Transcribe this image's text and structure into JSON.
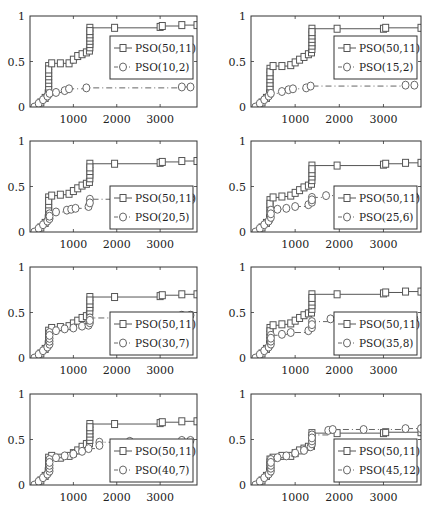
{
  "figure": {
    "layout": {
      "rows": 4,
      "cols": 2
    },
    "x_ticks": [
      1000,
      2000,
      3000
    ],
    "y_ticks": [
      0,
      0.5,
      1
    ],
    "y_tick_labels": [
      "0",
      "0.5",
      "1"
    ],
    "x_tick_labels": [
      "1000",
      "2000",
      "3000"
    ],
    "colors": {
      "axis": "#333333",
      "series_square": "#555555",
      "series_circle": "#666666"
    }
  },
  "chart_data": [
    {
      "type": "line",
      "title": "",
      "xlabel": "",
      "ylabel": "",
      "xlim": [
        0,
        3850
      ],
      "ylim": [
        0,
        1
      ],
      "legend": [
        "PSO(50,11)",
        "PSO(10,2)"
      ],
      "legend_position": "upper right (inside)",
      "series": [
        {
          "name": "PSO(50,11)",
          "marker": "square",
          "line": "solid",
          "x": [
            150,
            250,
            350,
            420,
            430,
            500,
            700,
            900,
            1000,
            1100,
            1200,
            1300,
            1370,
            1380,
            1950,
            3000,
            3050,
            3500,
            3850
          ],
          "y": [
            0.0,
            0.05,
            0.1,
            0.15,
            0.45,
            0.48,
            0.48,
            0.48,
            0.52,
            0.56,
            0.58,
            0.6,
            0.62,
            0.87,
            0.87,
            0.88,
            0.89,
            0.9,
            0.9
          ]
        },
        {
          "name": "PSO(10,2)",
          "marker": "circle",
          "line": "dashdot",
          "x": [
            100,
            200,
            300,
            400,
            450,
            600,
            800,
            900,
            1300,
            3500,
            3700
          ],
          "y": [
            0.0,
            0.04,
            0.08,
            0.12,
            0.15,
            0.16,
            0.18,
            0.2,
            0.21,
            0.22,
            0.22
          ]
        }
      ]
    },
    {
      "type": "line",
      "title": "",
      "xlabel": "",
      "ylabel": "",
      "xlim": [
        0,
        3850
      ],
      "ylim": [
        0,
        1
      ],
      "legend": [
        "PSO(50,11)",
        "PSO(15,2)"
      ],
      "legend_position": "upper right (inside)",
      "series": [
        {
          "name": "PSO(50,11)",
          "marker": "square",
          "line": "solid",
          "x": [
            150,
            250,
            350,
            420,
            430,
            500,
            700,
            900,
            1000,
            1100,
            1200,
            1300,
            1370,
            1380,
            1950,
            3000,
            3050,
            3850
          ],
          "y": [
            0.0,
            0.05,
            0.1,
            0.15,
            0.42,
            0.45,
            0.45,
            0.46,
            0.49,
            0.52,
            0.55,
            0.58,
            0.6,
            0.86,
            0.86,
            0.86,
            0.87,
            0.87
          ]
        },
        {
          "name": "PSO(15,2)",
          "marker": "circle",
          "line": "dashdot",
          "x": [
            100,
            200,
            300,
            400,
            450,
            700,
            850,
            950,
            1250,
            1350,
            3500,
            3700
          ],
          "y": [
            0.0,
            0.04,
            0.08,
            0.12,
            0.15,
            0.17,
            0.19,
            0.2,
            0.21,
            0.23,
            0.24,
            0.24
          ]
        }
      ]
    },
    {
      "type": "line",
      "title": "",
      "xlabel": "",
      "ylabel": "",
      "xlim": [
        0,
        3850
      ],
      "ylim": [
        0,
        1
      ],
      "legend": [
        "PSO(50,11)",
        "PSO(20,5)"
      ],
      "legend_position": "lower right (inside)",
      "series": [
        {
          "name": "PSO(50,11)",
          "marker": "square",
          "line": "solid",
          "x": [
            150,
            250,
            350,
            420,
            430,
            500,
            700,
            900,
            1000,
            1100,
            1200,
            1300,
            1370,
            1380,
            1950,
            3000,
            3050,
            3500,
            3850
          ],
          "y": [
            0.0,
            0.05,
            0.1,
            0.15,
            0.38,
            0.4,
            0.41,
            0.42,
            0.45,
            0.48,
            0.51,
            0.53,
            0.55,
            0.75,
            0.75,
            0.76,
            0.77,
            0.78,
            0.78
          ]
        },
        {
          "name": "PSO(20,5)",
          "marker": "circle",
          "line": "dashdot",
          "x": [
            100,
            200,
            300,
            400,
            450,
            600,
            850,
            950,
            1050,
            1350,
            1380,
            3500,
            3700
          ],
          "y": [
            0.0,
            0.04,
            0.08,
            0.12,
            0.2,
            0.22,
            0.24,
            0.25,
            0.26,
            0.28,
            0.36,
            0.37,
            0.37
          ]
        }
      ]
    },
    {
      "type": "line",
      "title": "",
      "xlabel": "",
      "ylabel": "",
      "xlim": [
        0,
        3850
      ],
      "ylim": [
        0,
        1
      ],
      "legend": [
        "PSO(50,11)",
        "PSO(25,6)"
      ],
      "legend_position": "lower right (inside)",
      "series": [
        {
          "name": "PSO(50,11)",
          "marker": "square",
          "line": "solid",
          "x": [
            150,
            250,
            350,
            420,
            430,
            500,
            700,
            900,
            1000,
            1100,
            1200,
            1300,
            1370,
            1380,
            1950,
            3000,
            3050,
            3500,
            3850
          ],
          "y": [
            0.0,
            0.05,
            0.1,
            0.15,
            0.35,
            0.38,
            0.39,
            0.4,
            0.43,
            0.46,
            0.49,
            0.51,
            0.53,
            0.73,
            0.73,
            0.74,
            0.75,
            0.76,
            0.76
          ]
        },
        {
          "name": "PSO(25,6)",
          "marker": "circle",
          "line": "dashdot",
          "x": [
            100,
            200,
            300,
            400,
            450,
            600,
            800,
            1000,
            1300,
            1380,
            1700,
            3500,
            3700
          ],
          "y": [
            0.0,
            0.04,
            0.08,
            0.12,
            0.24,
            0.25,
            0.26,
            0.28,
            0.3,
            0.38,
            0.4,
            0.4,
            0.4
          ]
        }
      ]
    },
    {
      "type": "line",
      "title": "",
      "xlabel": "",
      "ylabel": "",
      "xlim": [
        0,
        3850
      ],
      "ylim": [
        0,
        1
      ],
      "legend": [
        "PSO(50,11)",
        "PSO(30,7)"
      ],
      "legend_position": "lower right (inside)",
      "series": [
        {
          "name": "PSO(50,11)",
          "marker": "square",
          "line": "solid",
          "x": [
            150,
            250,
            350,
            420,
            430,
            500,
            700,
            900,
            1000,
            1100,
            1200,
            1300,
            1370,
            1380,
            1950,
            3000,
            3050,
            3500,
            3850
          ],
          "y": [
            0.0,
            0.05,
            0.1,
            0.15,
            0.3,
            0.33,
            0.34,
            0.35,
            0.38,
            0.41,
            0.44,
            0.46,
            0.48,
            0.67,
            0.67,
            0.68,
            0.69,
            0.7,
            0.7
          ]
        },
        {
          "name": "PSO(30,7)",
          "marker": "circle",
          "line": "dashdot",
          "x": [
            100,
            200,
            300,
            400,
            450,
            600,
            800,
            1000,
            1200,
            1350,
            1380,
            3500,
            3700
          ],
          "y": [
            0.0,
            0.04,
            0.08,
            0.12,
            0.28,
            0.3,
            0.32,
            0.33,
            0.35,
            0.36,
            0.44,
            0.47,
            0.47
          ]
        }
      ]
    },
    {
      "type": "line",
      "title": "",
      "xlabel": "",
      "ylabel": "",
      "xlim": [
        0,
        3850
      ],
      "ylim": [
        0,
        1
      ],
      "legend": [
        "PSO(50,11)",
        "PSO(35,8)"
      ],
      "legend_position": "lower right (inside)",
      "series": [
        {
          "name": "PSO(50,11)",
          "marker": "square",
          "line": "solid",
          "x": [
            150,
            250,
            350,
            420,
            430,
            500,
            700,
            900,
            1000,
            1100,
            1200,
            1300,
            1370,
            1380,
            1950,
            3000,
            3050,
            3500,
            3850
          ],
          "y": [
            0.0,
            0.05,
            0.1,
            0.15,
            0.33,
            0.36,
            0.37,
            0.38,
            0.41,
            0.44,
            0.47,
            0.49,
            0.5,
            0.7,
            0.7,
            0.71,
            0.72,
            0.73,
            0.73
          ]
        },
        {
          "name": "PSO(35,8)",
          "marker": "circle",
          "line": "dashdot",
          "x": [
            100,
            200,
            300,
            400,
            450,
            700,
            900,
            1300,
            1380,
            1800,
            3500,
            3700
          ],
          "y": [
            0.0,
            0.04,
            0.08,
            0.12,
            0.25,
            0.26,
            0.28,
            0.3,
            0.4,
            0.43,
            0.43,
            0.43
          ]
        }
      ]
    },
    {
      "type": "line",
      "title": "",
      "xlabel": "",
      "ylabel": "",
      "xlim": [
        0,
        3850
      ],
      "ylim": [
        0,
        1
      ],
      "legend": [
        "PSO(50,11)",
        "PSO(40,7)"
      ],
      "legend_position": "lower right (inside)",
      "series": [
        {
          "name": "PSO(50,11)",
          "marker": "square",
          "line": "solid",
          "x": [
            150,
            250,
            350,
            420,
            430,
            500,
            700,
            900,
            1000,
            1100,
            1200,
            1300,
            1370,
            1380,
            1950,
            3000,
            3050,
            3500,
            3850
          ],
          "y": [
            0.0,
            0.05,
            0.1,
            0.15,
            0.3,
            0.32,
            0.3,
            0.32,
            0.35,
            0.38,
            0.42,
            0.45,
            0.46,
            0.67,
            0.67,
            0.68,
            0.69,
            0.7,
            0.7
          ]
        },
        {
          "name": "PSO(40,7)",
          "marker": "circle",
          "line": "dashdot",
          "x": [
            100,
            200,
            300,
            400,
            450,
            600,
            800,
            1000,
            1200,
            1350,
            1600,
            2300,
            3500,
            3700
          ],
          "y": [
            0.0,
            0.04,
            0.08,
            0.12,
            0.28,
            0.3,
            0.32,
            0.34,
            0.37,
            0.4,
            0.47,
            0.48,
            0.49,
            0.49
          ]
        }
      ]
    },
    {
      "type": "line",
      "title": "",
      "xlabel": "",
      "ylabel": "",
      "xlim": [
        0,
        3850
      ],
      "ylim": [
        0,
        1
      ],
      "legend": [
        "PSO(50,11)",
        "PSO(45,12)"
      ],
      "legend_position": "lower right (inside)",
      "series": [
        {
          "name": "PSO(50,11)",
          "marker": "square",
          "line": "solid",
          "x": [
            150,
            250,
            350,
            420,
            430,
            500,
            700,
            900,
            1000,
            1100,
            1200,
            1300,
            1370,
            1380,
            1950,
            3000,
            3050,
            3850
          ],
          "y": [
            0.0,
            0.05,
            0.1,
            0.15,
            0.28,
            0.3,
            0.32,
            0.32,
            0.35,
            0.38,
            0.4,
            0.42,
            0.43,
            0.57,
            0.57,
            0.57,
            0.58,
            0.58
          ]
        },
        {
          "name": "PSO(45,12)",
          "marker": "circle",
          "line": "dashdot",
          "x": [
            100,
            200,
            300,
            400,
            450,
            600,
            800,
            1000,
            1200,
            1350,
            1380,
            1750,
            1850,
            2550,
            3500,
            3850
          ],
          "y": [
            0.0,
            0.04,
            0.08,
            0.12,
            0.28,
            0.3,
            0.32,
            0.35,
            0.38,
            0.42,
            0.55,
            0.6,
            0.61,
            0.61,
            0.62,
            0.62
          ]
        }
      ]
    }
  ]
}
